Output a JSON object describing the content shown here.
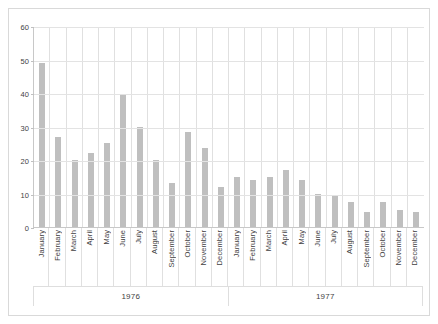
{
  "chart_data": {
    "type": "bar",
    "title": "",
    "subtitle": "",
    "xlabel": "",
    "ylabel": "",
    "ylim": [
      0,
      60
    ],
    "ytick_labels": [
      "0",
      "10",
      "20",
      "30",
      "40",
      "50",
      "60"
    ],
    "ytick_values": [
      0,
      10,
      20,
      30,
      40,
      50,
      60
    ],
    "grid": true,
    "legend": false,
    "bar_color": "#bfbfbf",
    "gridline_color": "#e3e3e3",
    "axis_color": "#c8c8c8",
    "categories": [
      "January",
      "February",
      "March",
      "April",
      "May",
      "June",
      "July",
      "August",
      "September",
      "October",
      "November",
      "December",
      "January",
      "February",
      "March",
      "April",
      "May",
      "June",
      "July",
      "August",
      "September",
      "October",
      "November",
      "December"
    ],
    "values": [
      49,
      27,
      20,
      22,
      25,
      39.5,
      30,
      20,
      13,
      28.5,
      23.5,
      12,
      15,
      14,
      15,
      17,
      14,
      10,
      9.5,
      7.5,
      4.5,
      7.5,
      5,
      4.5
    ],
    "groups": [
      {
        "label": "1976",
        "span": 12
      },
      {
        "label": "1977",
        "span": 12
      }
    ]
  }
}
